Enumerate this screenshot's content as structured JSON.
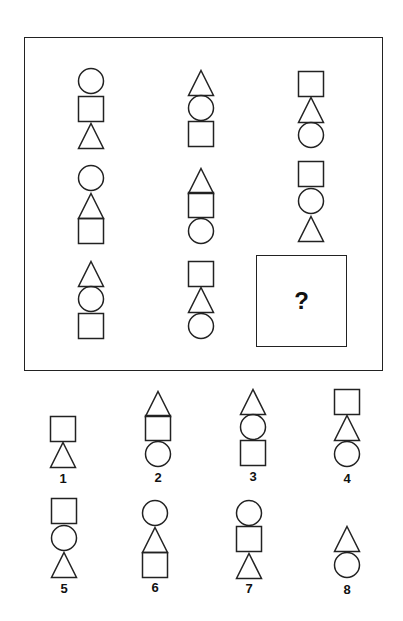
{
  "puzzle": {
    "frame": {
      "x": 24,
      "y": 37,
      "w": 359,
      "h": 334
    },
    "question_box": {
      "x": 256,
      "y": 255,
      "w": 91,
      "h": 92,
      "symbol": "?"
    },
    "stroke_color": "#222222",
    "shape_size": 26,
    "matrix": [
      {
        "row": 1,
        "col": 1,
        "cx": 91,
        "stack": [
          {
            "shape": "circle",
            "y": 68
          },
          {
            "shape": "square",
            "y": 96
          },
          {
            "shape": "triangle",
            "y": 123
          }
        ]
      },
      {
        "row": 1,
        "col": 2,
        "cx": 201,
        "stack": [
          {
            "shape": "triangle",
            "y": 70
          },
          {
            "shape": "circle",
            "y": 95
          },
          {
            "shape": "square",
            "y": 121
          }
        ]
      },
      {
        "row": 1,
        "col": 3,
        "cx": 311,
        "stack": [
          {
            "shape": "square",
            "y": 71
          },
          {
            "shape": "triangle",
            "y": 97
          },
          {
            "shape": "circle",
            "y": 122
          }
        ]
      },
      {
        "row": 2,
        "col": 1,
        "cx": 91,
        "stack": [
          {
            "shape": "circle",
            "y": 165
          },
          {
            "shape": "triangle",
            "y": 193
          },
          {
            "shape": "square",
            "y": 218
          }
        ]
      },
      {
        "row": 2,
        "col": 2,
        "cx": 201,
        "stack": [
          {
            "shape": "triangle",
            "y": 168
          },
          {
            "shape": "square",
            "y": 192
          },
          {
            "shape": "circle",
            "y": 218
          }
        ]
      },
      {
        "row": 2,
        "col": 3,
        "cx": 311,
        "stack": [
          {
            "shape": "square",
            "y": 161
          },
          {
            "shape": "circle",
            "y": 188
          },
          {
            "shape": "triangle",
            "y": 216
          }
        ]
      },
      {
        "row": 3,
        "col": 1,
        "cx": 91,
        "stack": [
          {
            "shape": "triangle",
            "y": 261
          },
          {
            "shape": "circle",
            "y": 286
          },
          {
            "shape": "square",
            "y": 313
          }
        ]
      },
      {
        "row": 3,
        "col": 2,
        "cx": 201,
        "stack": [
          {
            "shape": "square",
            "y": 261
          },
          {
            "shape": "triangle",
            "y": 287
          },
          {
            "shape": "circle",
            "y": 313
          }
        ]
      }
    ]
  },
  "options": [
    {
      "label": "1",
      "cx": 63,
      "label_y": 472,
      "stack": [
        {
          "shape": "square",
          "y": 416
        },
        {
          "shape": "triangle",
          "y": 442
        }
      ]
    },
    {
      "label": "2",
      "cx": 158,
      "label_y": 471,
      "stack": [
        {
          "shape": "triangle",
          "y": 391
        },
        {
          "shape": "square",
          "y": 415
        },
        {
          "shape": "circle",
          "y": 441
        }
      ]
    },
    {
      "label": "3",
      "cx": 253,
      "label_y": 470,
      "stack": [
        {
          "shape": "triangle",
          "y": 389
        },
        {
          "shape": "circle",
          "y": 414
        },
        {
          "shape": "square",
          "y": 440
        }
      ]
    },
    {
      "label": "4",
      "cx": 347,
      "label_y": 472,
      "stack": [
        {
          "shape": "square",
          "y": 389
        },
        {
          "shape": "triangle",
          "y": 415
        },
        {
          "shape": "circle",
          "y": 441
        }
      ]
    },
    {
      "label": "5",
      "cx": 64,
      "label_y": 582,
      "stack": [
        {
          "shape": "square",
          "y": 498
        },
        {
          "shape": "circle",
          "y": 525
        },
        {
          "shape": "triangle",
          "y": 552
        }
      ]
    },
    {
      "label": "6",
      "cx": 155,
      "label_y": 581,
      "stack": [
        {
          "shape": "circle",
          "y": 500
        },
        {
          "shape": "triangle",
          "y": 527
        },
        {
          "shape": "square",
          "y": 552
        }
      ]
    },
    {
      "label": "7",
      "cx": 249,
      "label_y": 582,
      "stack": [
        {
          "shape": "circle",
          "y": 500
        },
        {
          "shape": "square",
          "y": 526
        },
        {
          "shape": "triangle",
          "y": 553
        }
      ]
    },
    {
      "label": "8",
      "cx": 347,
      "label_y": 583,
      "stack": [
        {
          "shape": "triangle",
          "y": 526
        },
        {
          "shape": "circle",
          "y": 552
        }
      ]
    }
  ]
}
